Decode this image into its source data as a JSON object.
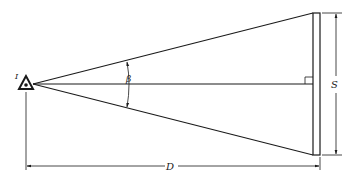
{
  "diagram": {
    "observer_label": "I",
    "angle_label": "β",
    "screen_height_label": "S",
    "distance_label": "D",
    "colors": {
      "ink": "#1a1a1a",
      "background": "#ffffff"
    }
  }
}
